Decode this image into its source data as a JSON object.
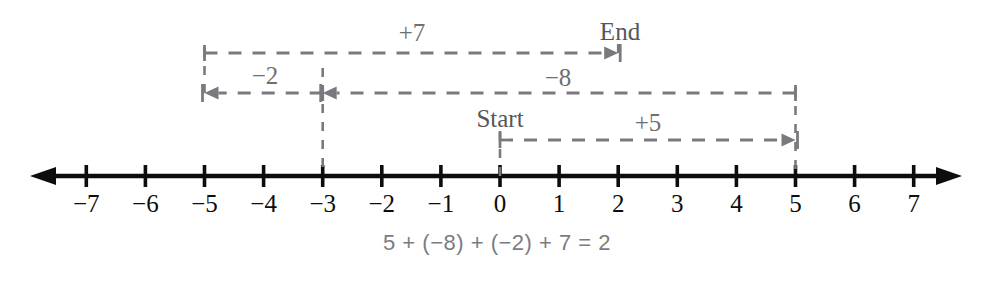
{
  "diagram": {
    "title_text": "",
    "colors": {
      "axis": "#0d0d0d",
      "dashed": "#7a7a7e",
      "step_label": "#6f6f72",
      "anchor_label": "#56565a",
      "equation": "#7c7c80",
      "background": "#ffffff"
    },
    "number_line": {
      "y": 176,
      "x_origin": 500,
      "unit_px": 59.1,
      "min": -7,
      "max": 7,
      "left_arrow_x": 30,
      "right_arrow_x": 962,
      "tick_labels": [
        "−7",
        "−6",
        "−5",
        "−4",
        "−3",
        "−2",
        "−1",
        "0",
        "1",
        "2",
        "3",
        "4",
        "5",
        "6",
        "7"
      ],
      "tick_values": [
        -7,
        -6,
        -5,
        -4,
        -3,
        -2,
        -1,
        0,
        1,
        2,
        3,
        4,
        5,
        6,
        7
      ],
      "tick_label_y": 203
    },
    "anchors": [
      {
        "name": "start",
        "label": "Start",
        "x": 500,
        "y": 118,
        "value": 0
      },
      {
        "name": "end",
        "label": "End",
        "x": 620,
        "y": 31,
        "value": 2
      }
    ],
    "steps": [
      {
        "name": "plus-five",
        "label": "+5",
        "from_value": 0,
        "to_value": 5,
        "row_y": 140,
        "direction": "right",
        "label_x": 648,
        "label_y": 122
      },
      {
        "name": "minus-eight",
        "label": "−8",
        "from_value": 5,
        "to_value": -3,
        "row_y": 93,
        "direction": "left",
        "label_x": 558,
        "label_y": 77
      },
      {
        "name": "minus-two",
        "label": "−2",
        "from_value": -3,
        "to_value": -5,
        "row_y": 93,
        "direction": "left",
        "label_x": 265,
        "label_y": 75
      },
      {
        "name": "plus-seven",
        "label": "+7",
        "from_value": -5,
        "to_value": 2,
        "row_y": 53,
        "direction": "right",
        "label_x": 412,
        "label_y": 32
      }
    ],
    "connectors": [
      {
        "name": "connector-at-0",
        "value": 0,
        "top_y": 131,
        "bottom_y": 176
      },
      {
        "name": "connector-at-5",
        "value": 5,
        "top_y": 88,
        "bottom_y": 176
      },
      {
        "name": "connector-at-minus-3",
        "value": -3,
        "top_y": 68,
        "bottom_y": 176
      },
      {
        "name": "connector-at-minus-5",
        "value": -5,
        "top_y": 48,
        "bottom_y": 98
      },
      {
        "name": "connector-at-2",
        "value": 2,
        "top_y": 44,
        "bottom_y": 62
      }
    ],
    "equation": {
      "text": "5 + (−8) + (−2) + 7 = 2",
      "x": 497,
      "y": 243
    }
  }
}
